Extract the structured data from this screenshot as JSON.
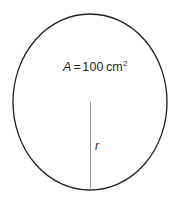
{
  "figure": {
    "background_color": "#ffffff",
    "stroke_color": "#231f20",
    "radius_line_color": "#9a9a9a",
    "circle": {
      "center_x": 90,
      "center_y": 102,
      "radius_x": 77,
      "radius_y": 88,
      "stroke_width": 1.3
    },
    "radius_line": {
      "x": 90.5,
      "y_start": 102,
      "y_end": 190,
      "stroke_width": 1
    },
    "labels": {
      "area": {
        "symbol": "A",
        "equals": "=",
        "value": "100",
        "unit": "cm",
        "exponent": "2",
        "full_text": "A = 100 cm2"
      },
      "radius": {
        "symbol": "r"
      }
    }
  }
}
